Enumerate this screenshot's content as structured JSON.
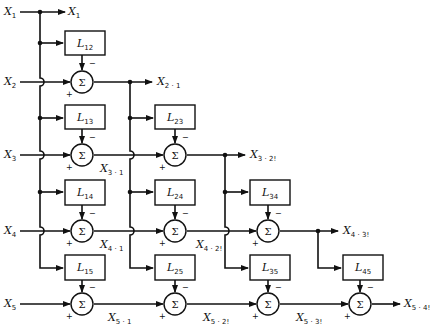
{
  "diagram": {
    "type": "block-diagram",
    "inputs": [
      {
        "name": "X",
        "sub": "1"
      },
      {
        "name": "X",
        "sub": "2"
      },
      {
        "name": "X",
        "sub": "3"
      },
      {
        "name": "X",
        "sub": "4"
      },
      {
        "name": "X",
        "sub": "5"
      }
    ],
    "blocks": [
      {
        "name": "L",
        "sub": "12"
      },
      {
        "name": "L",
        "sub": "13"
      },
      {
        "name": "L",
        "sub": "14"
      },
      {
        "name": "L",
        "sub": "15"
      },
      {
        "name": "L",
        "sub": "23"
      },
      {
        "name": "L",
        "sub": "24"
      },
      {
        "name": "L",
        "sub": "25"
      },
      {
        "name": "L",
        "sub": "34"
      },
      {
        "name": "L",
        "sub": "35"
      },
      {
        "name": "L",
        "sub": "45"
      }
    ],
    "sum_symbol": "Σ",
    "plus_sign": "+",
    "minus_sign": "−",
    "intermediate_labels": [
      {
        "name": "X",
        "sub": "3 · 1"
      },
      {
        "name": "X",
        "sub": "4 · 1"
      },
      {
        "name": "X",
        "sub": "4 · 2!"
      },
      {
        "name": "X",
        "sub": "5 · 1"
      },
      {
        "name": "X",
        "sub": "5 · 2!"
      },
      {
        "name": "X",
        "sub": "5 · 3!"
      }
    ],
    "outputs": [
      {
        "name": "X",
        "sub": "1"
      },
      {
        "name": "X",
        "sub": "2 · 1"
      },
      {
        "name": "X",
        "sub": "3 · 2!"
      },
      {
        "name": "X",
        "sub": "4 · 3!"
      },
      {
        "name": "X",
        "sub": "5 · 4!"
      }
    ]
  }
}
